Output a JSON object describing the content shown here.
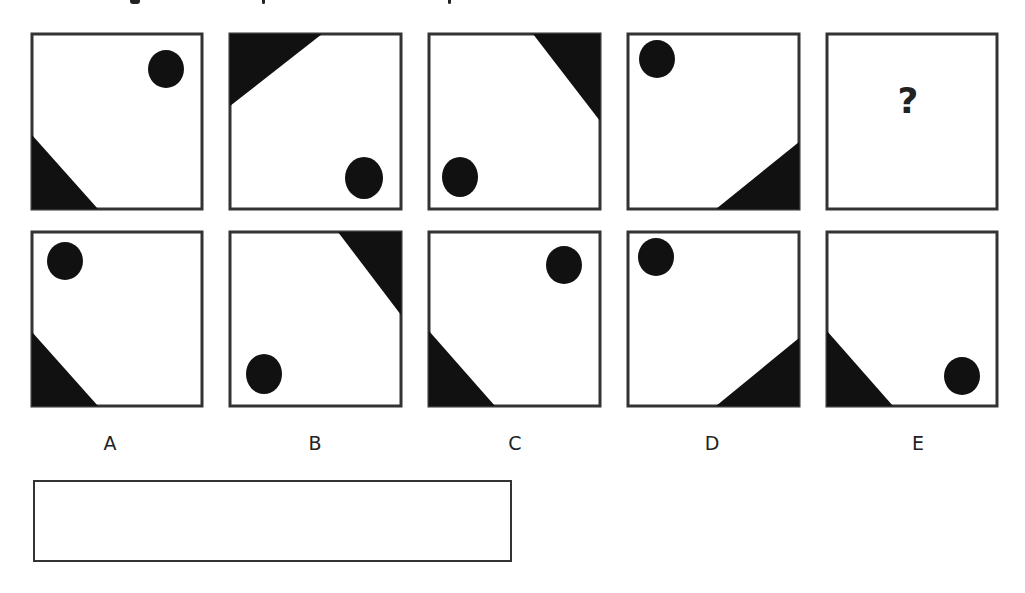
{
  "puzzle": {
    "top_instruction_text_clipped": true,
    "sequence": [
      {
        "id": "seq-1",
        "triangle_corner": "bottom-left",
        "circle_corner": "top-right"
      },
      {
        "id": "seq-2",
        "triangle_corner": "top-left",
        "circle_corner": "bottom-right"
      },
      {
        "id": "seq-3",
        "triangle_corner": "top-right",
        "circle_corner": "bottom-left"
      },
      {
        "id": "seq-4",
        "triangle_corner": "bottom-right",
        "circle_corner": "top-left"
      },
      {
        "id": "seq-5",
        "unknown": true,
        "label": "?"
      }
    ],
    "options": [
      {
        "label": "A",
        "triangle_corner": "bottom-left",
        "circle_corner": "top-left"
      },
      {
        "label": "B",
        "triangle_corner": "top-right",
        "circle_corner": "bottom-left"
      },
      {
        "label": "C",
        "triangle_corner": "bottom-left",
        "circle_corner": "top-right"
      },
      {
        "label": "D",
        "triangle_corner": "bottom-right",
        "circle_corner": "top-left"
      },
      {
        "label": "E",
        "triangle_corner": "bottom-left",
        "circle_corner": "bottom-right"
      }
    ],
    "answer_box": {
      "value": ""
    }
  },
  "colors": {
    "shape": "#111111",
    "border": "#333333",
    "background": "#ffffff"
  }
}
